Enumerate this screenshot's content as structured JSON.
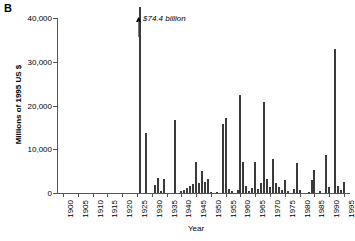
{
  "figure": {
    "panel_label": "B",
    "annotation": "$74.4 billion",
    "annotation_icon": "up-arrow-icon"
  },
  "chart_data": {
    "type": "bar",
    "title": "",
    "xlabel": "Year",
    "ylabel": "Millions of 1995 US $",
    "ylim": [
      0,
      40000
    ],
    "xlim": [
      1898,
      1997
    ],
    "grid": false,
    "legend": null,
    "yticks": [
      0,
      10000,
      20000,
      30000,
      40000
    ],
    "ytick_labels": [
      "0",
      "10,000",
      "20,000",
      "30,000",
      "40,000"
    ],
    "xticks": [
      1900,
      1905,
      1910,
      1915,
      1920,
      1925,
      1930,
      1935,
      1940,
      1945,
      1950,
      1955,
      1960,
      1965,
      1970,
      1975,
      1980,
      1985,
      1990,
      1995
    ],
    "xtick_labels": [
      "1900",
      "1905",
      "1910",
      "1915",
      "1920",
      "1925",
      "1930",
      "1935",
      "1940",
      "1945",
      "1950",
      "1955",
      "1960",
      "1965",
      "1970",
      "1975",
      "1980",
      "1985",
      "1990",
      "1995"
    ],
    "bar_color": "#3a3a3a",
    "annotations": [
      {
        "x": 1926,
        "text": "$74.4 billion",
        "value": 74400,
        "note": "bar truncated at top of axis"
      }
    ],
    "x": [
      1926,
      1928,
      1931,
      1932,
      1933,
      1934,
      1938,
      1940,
      1941,
      1942,
      1943,
      1944,
      1945,
      1946,
      1947,
      1948,
      1949,
      1950,
      1952,
      1954,
      1955,
      1956,
      1957,
      1959,
      1960,
      1961,
      1962,
      1963,
      1964,
      1965,
      1966,
      1967,
      1968,
      1969,
      1970,
      1971,
      1972,
      1973,
      1974,
      1975,
      1976,
      1978,
      1979,
      1980,
      1983,
      1984,
      1985,
      1987,
      1989,
      1990,
      1992,
      1993,
      1994,
      1995
    ],
    "values": [
      74400,
      13800,
      1800,
      3500,
      400,
      3100,
      16600,
      400,
      800,
      1100,
      1500,
      2000,
      7200,
      2300,
      5100,
      2600,
      3200,
      300,
      250,
      15800,
      17200,
      900,
      400,
      600,
      22400,
      7200,
      1600,
      500,
      1100,
      7100,
      900,
      2300,
      20800,
      3200,
      1400,
      7800,
      2400,
      1400,
      600,
      2900,
      400,
      1000,
      6800,
      600,
      300,
      3000,
      5200,
      350,
      8600,
      1300,
      32900,
      1700,
      600,
      2600
    ]
  }
}
